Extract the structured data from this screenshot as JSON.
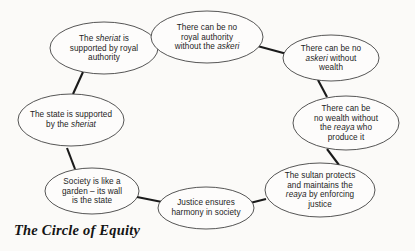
{
  "figure": {
    "caption": "The Circle of Equity",
    "background_color": "#fbfaf8",
    "node_fill": "#fdfcfb",
    "node_stroke": "#2b2b2b",
    "connector_color": "#1a1a1a"
  },
  "diagram": {
    "type": "cycle",
    "node_count": 8,
    "nodes": [
      {
        "id": "sheriat-royal-authority",
        "text": "The sheriat is supported by royal authority",
        "lines": [
          "The sheriat is",
          "supported by royal",
          "authority"
        ],
        "italic_terms": [
          "sheriat"
        ],
        "cx": 104,
        "cy": 48,
        "rx": 54,
        "ry": 26
      },
      {
        "id": "royal-authority-askeri",
        "text": "There can be no royal authority without the askeri",
        "lines": [
          "There can be no",
          "royal authority",
          "without the askeri"
        ],
        "italic_terms": [
          "askeri"
        ],
        "cx": 207,
        "cy": 37,
        "rx": 56,
        "ry": 26
      },
      {
        "id": "askeri-wealth",
        "text": "There can be no askeri without wealth",
        "lines": [
          "There can be no",
          "askeri without",
          "wealth"
        ],
        "italic_terms": [
          "askeri"
        ],
        "cx": 331,
        "cy": 58,
        "rx": 48,
        "ry": 23
      },
      {
        "id": "wealth-reaya",
        "text": "There can be no wealth without the reaya who produce it",
        "lines": [
          "There can be",
          "no wealth without",
          "the reaya who",
          "produce it"
        ],
        "italic_terms": [
          "reaya"
        ],
        "cx": 346,
        "cy": 123,
        "rx": 53,
        "ry": 27
      },
      {
        "id": "sultan-protects-reaya",
        "text": "The sultan protects and maintains the reaya by enforcing justice",
        "lines": [
          "The sultan protects",
          "and maintains the",
          "reaya by enforcing",
          "justice"
        ],
        "italic_terms": [
          "reaya"
        ],
        "cx": 320,
        "cy": 190,
        "rx": 55,
        "ry": 27
      },
      {
        "id": "justice-harmony",
        "text": "Justice ensures harmony in society",
        "lines": [
          "Justice ensures",
          "harmony in society"
        ],
        "italic_terms": [],
        "cx": 206,
        "cy": 208,
        "rx": 48,
        "ry": 21
      },
      {
        "id": "society-garden",
        "text": "Society is like a garden – its wall is the state",
        "lines": [
          "Society is like a",
          "garden – its wall",
          "is the state"
        ],
        "italic_terms": [],
        "cx": 92,
        "cy": 191,
        "rx": 47,
        "ry": 23
      },
      {
        "id": "state-sheriat",
        "text": "The state is supported by the sheriat",
        "lines": [
          "The state is supported",
          "by the sheriat"
        ],
        "italic_terms": [
          "sheriat"
        ],
        "cx": 71,
        "cy": 120,
        "rx": 53,
        "ry": 26
      }
    ],
    "connectors": [
      {
        "from": "sheriat-royal-authority",
        "to": "royal-authority-askeri",
        "x1": 150,
        "y1": 38,
        "x2": 167,
        "y2": 30
      },
      {
        "from": "royal-authority-askeri",
        "to": "askeri-wealth",
        "x1": 250,
        "y1": 44,
        "x2": 287,
        "y2": 54
      },
      {
        "from": "askeri-wealth",
        "to": "wealth-reaya",
        "x1": 318,
        "y1": 80,
        "x2": 327,
        "y2": 97
      },
      {
        "from": "wealth-reaya",
        "to": "sultan-protects-reaya",
        "x1": 327,
        "y1": 149,
        "x2": 339,
        "y2": 165
      },
      {
        "from": "sultan-protects-reaya",
        "to": "justice-harmony",
        "x1": 266,
        "y1": 199,
        "x2": 250,
        "y2": 203
      },
      {
        "from": "justice-harmony",
        "to": "society-garden",
        "x1": 162,
        "y1": 202,
        "x2": 137,
        "y2": 197
      },
      {
        "from": "society-garden",
        "to": "state-sheriat",
        "x1": 75,
        "y1": 169,
        "x2": 67,
        "y2": 148
      },
      {
        "from": "state-sheriat",
        "to": "sheriat-royal-authority",
        "x1": 73,
        "y1": 94,
        "x2": 83,
        "y2": 72
      }
    ]
  }
}
